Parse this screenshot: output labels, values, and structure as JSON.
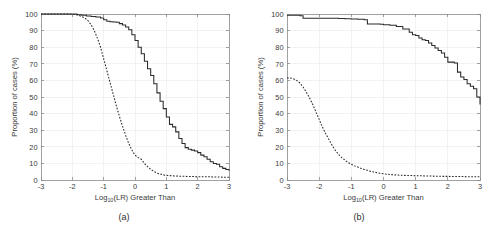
{
  "figure": {
    "background": "#ffffff",
    "line_color": "#2b2b2b",
    "grid_color": "#ececec",
    "axis_color": "#8a8a8a"
  },
  "chart_data": [
    {
      "type": "line",
      "panel": "a",
      "caption": "(a)",
      "title": "",
      "xlabel_base": "Log",
      "xlabel_sub": "10",
      "xlabel_rest": "(LR) Greater Than",
      "xlabel": "Log10(LR) Greater Than",
      "ylabel": "Proportion of cases (%)",
      "xlim": [
        -3,
        3
      ],
      "ylim": [
        0,
        100
      ],
      "xticks": [
        -3,
        -2,
        -1,
        0,
        1,
        2,
        3
      ],
      "xticklabels": [
        "-3",
        "-2",
        "-1",
        "0",
        "1",
        "2",
        "3"
      ],
      "yticks": [
        0,
        10,
        20,
        30,
        40,
        50,
        60,
        70,
        80,
        90,
        100
      ],
      "yticklabels": [
        "0",
        "10",
        "20",
        "30",
        "40",
        "50",
        "60",
        "70",
        "80",
        "90",
        "100"
      ],
      "grid": true,
      "legend": "none",
      "series": [
        {
          "name": "solid",
          "style": "solid",
          "x": [
            -3,
            -2.8,
            -2.6,
            -2.4,
            -2.2,
            -2.0,
            -1.85,
            -1.7,
            -1.55,
            -1.4,
            -1.25,
            -1.1,
            -1.0,
            -0.9,
            -0.8,
            -0.7,
            -0.6,
            -0.5,
            -0.4,
            -0.3,
            -0.2,
            -0.1,
            0.0,
            0.1,
            0.2,
            0.3,
            0.4,
            0.5,
            0.6,
            0.7,
            0.8,
            0.9,
            1.0,
            1.1,
            1.2,
            1.3,
            1.4,
            1.5,
            1.6,
            1.7,
            1.8,
            1.9,
            2.0,
            2.1,
            2.2,
            2.3,
            2.4,
            2.5,
            2.6,
            2.7,
            2.8,
            2.9,
            3.0
          ],
          "y": [
            100,
            100,
            100,
            100,
            100,
            100,
            99.5,
            99.2,
            98.8,
            98.5,
            98.2,
            97.6,
            96.5,
            95.6,
            95.3,
            95.2,
            95.0,
            94.2,
            93.4,
            92.2,
            90.5,
            87.5,
            84.0,
            80.0,
            76.0,
            71.5,
            67.0,
            63.0,
            58.0,
            52.5,
            47.5,
            43.0,
            38.0,
            33.5,
            32.0,
            29.0,
            25.0,
            22.0,
            19.5,
            18.5,
            18.0,
            17.5,
            16.5,
            15.0,
            14.0,
            12.5,
            11.0,
            10.0,
            9.5,
            8.0,
            7.0,
            6.3,
            5.5
          ]
        },
        {
          "name": "dashed",
          "style": "dashed",
          "x": [
            -3,
            -2.8,
            -2.6,
            -2.4,
            -2.2,
            -2.0,
            -1.85,
            -1.7,
            -1.6,
            -1.5,
            -1.4,
            -1.3,
            -1.2,
            -1.1,
            -1.0,
            -0.9,
            -0.8,
            -0.7,
            -0.6,
            -0.5,
            -0.4,
            -0.3,
            -0.2,
            -0.1,
            0.0,
            0.1,
            0.2,
            0.3,
            0.4,
            0.5,
            0.6,
            0.7,
            0.8,
            0.9,
            1.0,
            1.2,
            1.4,
            1.6,
            1.8,
            2.0,
            2.2,
            2.4,
            2.6,
            2.8,
            3.0
          ],
          "y": [
            100,
            100,
            100,
            100,
            100,
            99.8,
            99.5,
            98.5,
            97.5,
            96.0,
            93.5,
            90.0,
            85.5,
            80.0,
            73.0,
            66.0,
            59.0,
            52.0,
            45.0,
            38.5,
            32.5,
            27.0,
            22.0,
            18.0,
            15.0,
            13.5,
            12.5,
            10.0,
            8.0,
            6.5,
            5.2,
            4.2,
            3.6,
            3.1,
            2.8,
            2.5,
            2.3,
            2.2,
            2.1,
            2.0,
            2.0,
            1.9,
            1.8,
            1.7,
            1.6
          ]
        }
      ]
    },
    {
      "type": "line",
      "panel": "b",
      "caption": "(b)",
      "title": "",
      "xlabel_base": "Log",
      "xlabel_sub": "10",
      "xlabel_rest": "(LR) Greater Than",
      "xlabel": "Log10(LR) Greater Than",
      "ylabel": "Proportion of cases (%)",
      "xlim": [
        -3,
        3
      ],
      "ylim": [
        0,
        100
      ],
      "xticks": [
        -3,
        -2,
        -1,
        0,
        1,
        2,
        3
      ],
      "xticklabels": [
        "-3",
        "-2",
        "-1",
        "0",
        "1",
        "2",
        "3"
      ],
      "yticks": [
        0,
        10,
        20,
        30,
        40,
        50,
        60,
        70,
        80,
        90,
        100
      ],
      "yticklabels": [
        "0",
        "10",
        "20",
        "30",
        "40",
        "50",
        "60",
        "70",
        "80",
        "90",
        "100"
      ],
      "grid": true,
      "legend": "none",
      "series": [
        {
          "name": "solid",
          "style": "solid",
          "x": [
            -3,
            -2.8,
            -2.6,
            -2.5,
            -2.4,
            -2.2,
            -2.0,
            -1.8,
            -1.6,
            -1.4,
            -1.2,
            -1.0,
            -0.8,
            -0.6,
            -0.5,
            -0.4,
            -0.3,
            -0.2,
            -0.1,
            0.0,
            0.2,
            0.4,
            0.6,
            0.8,
            0.9,
            1.0,
            1.1,
            1.2,
            1.3,
            1.4,
            1.5,
            1.6,
            1.7,
            1.8,
            1.9,
            2.0,
            2.1,
            2.2,
            2.3,
            2.4,
            2.5,
            2.6,
            2.7,
            2.8,
            2.9,
            3.0
          ],
          "y": [
            99.2,
            99.2,
            99.0,
            97.5,
            97.5,
            97.5,
            97.5,
            97.5,
            97.4,
            97.3,
            97.2,
            97.0,
            96.8,
            96.5,
            94.0,
            94.0,
            94.0,
            94.0,
            93.8,
            93.5,
            93.2,
            92.5,
            91.0,
            89.0,
            87.5,
            87.0,
            85.5,
            84.5,
            84.0,
            82.5,
            81.0,
            79.5,
            78.0,
            76.5,
            74.0,
            71.0,
            71.0,
            70.5,
            65.0,
            62.0,
            60.5,
            58.0,
            56.5,
            55.0,
            50.0,
            45.5
          ]
        },
        {
          "name": "dashed",
          "style": "dashed",
          "x": [
            -3,
            -2.9,
            -2.8,
            -2.7,
            -2.6,
            -2.5,
            -2.4,
            -2.3,
            -2.2,
            -2.1,
            -2.0,
            -1.9,
            -1.8,
            -1.7,
            -1.6,
            -1.5,
            -1.4,
            -1.3,
            -1.2,
            -1.1,
            -1.0,
            -0.9,
            -0.8,
            -0.7,
            -0.6,
            -0.5,
            -0.4,
            -0.3,
            -0.2,
            -0.1,
            0.0,
            0.2,
            0.4,
            0.6,
            0.8,
            1.0,
            1.2,
            1.4,
            1.6,
            1.8,
            2.0,
            2.2,
            2.4,
            2.6,
            2.8,
            3.0
          ],
          "y": [
            61.5,
            61.5,
            61.0,
            60.0,
            58.5,
            56.0,
            53.0,
            49.5,
            45.5,
            41.0,
            36.5,
            32.0,
            28.0,
            24.5,
            21.0,
            18.0,
            15.5,
            13.5,
            12.0,
            10.5,
            9.5,
            8.5,
            7.8,
            7.0,
            6.4,
            5.8,
            5.2,
            4.8,
            4.4,
            4.0,
            3.7,
            3.3,
            3.0,
            2.8,
            2.7,
            2.6,
            2.5,
            2.4,
            2.3,
            2.2,
            2.2,
            2.1,
            2.1,
            2.0,
            2.0,
            2.0
          ]
        }
      ]
    }
  ]
}
